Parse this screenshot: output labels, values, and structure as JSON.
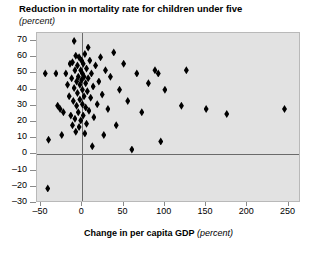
{
  "chart_data": {
    "type": "scatter",
    "title": "Reduction in mortality rate for children under five",
    "subtitle": "(percent)",
    "xlabel": "Change in per capita GDP",
    "xlabel_unit": "(percent)",
    "ylabel": "Reduction in mortality rate for children under five",
    "ylabel_unit": "(percent)",
    "xlim": [
      -55,
      265
    ],
    "ylim": [
      -30,
      75
    ],
    "xticks": [
      -50,
      0,
      50,
      100,
      150,
      200,
      250
    ],
    "xtick_labels": [
      "–50",
      "0",
      "50",
      "100",
      "150",
      "200",
      "250"
    ],
    "yticks": [
      -30,
      -20,
      -10,
      0,
      10,
      20,
      30,
      40,
      50,
      60,
      70
    ],
    "ytick_labels": [
      "–30",
      "–20",
      "–10",
      "0",
      "10",
      "20",
      "30",
      "40",
      "50",
      "60",
      "70"
    ],
    "grid": false,
    "legend": "none",
    "marker_shape": "diamond",
    "marker_color": "#000000",
    "plot_background": "#e2e2e2",
    "reference_lines": {
      "horizontal_y": 0,
      "vertical_x": 0,
      "color": "#6a6a6a"
    },
    "points": [
      [
        -45,
        50
      ],
      [
        -42,
        -21
      ],
      [
        -41,
        9
      ],
      [
        -32,
        50
      ],
      [
        -30,
        30
      ],
      [
        -27,
        28
      ],
      [
        -25,
        12
      ],
      [
        -23,
        26
      ],
      [
        -20,
        50
      ],
      [
        -18,
        43
      ],
      [
        -16,
        36
      ],
      [
        -15,
        56
      ],
      [
        -14,
        24
      ],
      [
        -13,
        47
      ],
      [
        -12,
        18
      ],
      [
        -12,
        57
      ],
      [
        -11,
        33
      ],
      [
        -10,
        70
      ],
      [
        -10,
        41
      ],
      [
        -9,
        22
      ],
      [
        -9,
        52
      ],
      [
        -8,
        61
      ],
      [
        -8,
        14
      ],
      [
        -7,
        45
      ],
      [
        -7,
        30
      ],
      [
        -6,
        55
      ],
      [
        -6,
        38
      ],
      [
        -5,
        26
      ],
      [
        -5,
        48
      ],
      [
        -4,
        60
      ],
      [
        -4,
        17
      ],
      [
        -3,
        43
      ],
      [
        -3,
        34
      ],
      [
        -2,
        52
      ],
      [
        -2,
        21
      ],
      [
        -1,
        46
      ],
      [
        -1,
        58
      ],
      [
        0,
        31
      ],
      [
        0,
        50
      ],
      [
        0,
        40
      ],
      [
        1,
        24
      ],
      [
        1,
        56
      ],
      [
        2,
        36
      ],
      [
        2,
        48
      ],
      [
        3,
        13
      ],
      [
        3,
        62
      ],
      [
        4,
        44
      ],
      [
        4,
        29
      ],
      [
        5,
        53
      ],
      [
        5,
        19
      ],
      [
        6,
        39
      ],
      [
        7,
        66
      ],
      [
        7,
        47
      ],
      [
        8,
        27
      ],
      [
        9,
        58
      ],
      [
        10,
        35
      ],
      [
        11,
        50
      ],
      [
        12,
        5
      ],
      [
        13,
        42
      ],
      [
        14,
        23
      ],
      [
        16,
        55
      ],
      [
        18,
        31
      ],
      [
        20,
        45
      ],
      [
        22,
        60
      ],
      [
        24,
        37
      ],
      [
        26,
        12
      ],
      [
        28,
        52
      ],
      [
        31,
        28
      ],
      [
        34,
        48
      ],
      [
        38,
        63
      ],
      [
        41,
        18
      ],
      [
        45,
        40
      ],
      [
        50,
        56
      ],
      [
        55,
        33
      ],
      [
        60,
        3
      ],
      [
        66,
        50
      ],
      [
        72,
        26
      ],
      [
        80,
        44
      ],
      [
        88,
        52
      ],
      [
        92,
        50
      ],
      [
        95,
        8
      ],
      [
        100,
        40
      ],
      [
        120,
        30
      ],
      [
        126,
        52
      ],
      [
        150,
        28
      ],
      [
        175,
        25
      ],
      [
        245,
        28
      ]
    ]
  }
}
